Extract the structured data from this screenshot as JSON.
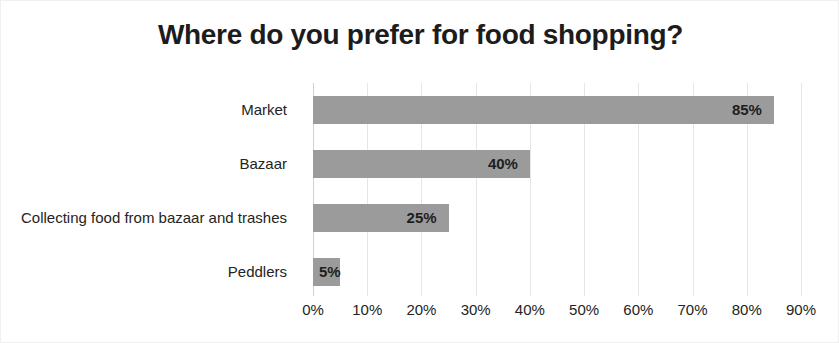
{
  "chart_data": {
    "type": "bar",
    "orientation": "horizontal",
    "title": "Where do you prefer for food shopping?",
    "xlabel": "",
    "ylabel": "",
    "categories": [
      "Market",
      "Bazaar",
      "Collecting food from bazaar and trashes",
      "Peddlers"
    ],
    "values": [
      85,
      40,
      25,
      5
    ],
    "value_labels": [
      "85%",
      "40%",
      "25%",
      "5%"
    ],
    "xlim": [
      0,
      90
    ],
    "xticks": [
      0,
      10,
      20,
      30,
      40,
      50,
      60,
      70,
      80,
      90
    ],
    "xtick_labels": [
      "0%",
      "10%",
      "20%",
      "30%",
      "40%",
      "50%",
      "60%",
      "70%",
      "80%",
      "90%"
    ],
    "grid": true,
    "grid_axis": "x",
    "legend": false,
    "legend_position": "none",
    "bar_color": "#9b9b9b",
    "grid_color": "#e6e6e6",
    "title_color": "#1c1c1c",
    "label_color": "#242424",
    "background_color": "#ffffff"
  }
}
